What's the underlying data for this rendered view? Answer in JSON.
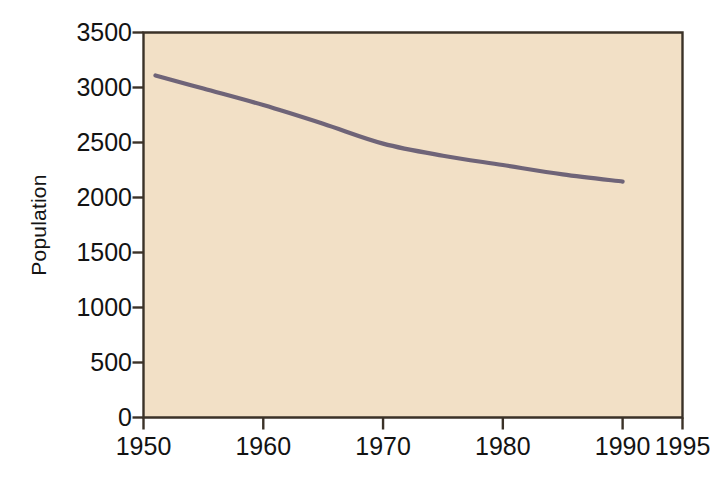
{
  "figure": {
    "background_color": "#ffffff",
    "plot_background_color": "#f2e0c6",
    "axis_color": "#3b3228",
    "line_color": "#6f6478"
  },
  "chart_data": {
    "type": "line",
    "title": "",
    "subtitle": "",
    "xlabel": "",
    "ylabel": "Population",
    "xlim": [
      1950,
      1995
    ],
    "ylim": [
      0,
      3500
    ],
    "grid": false,
    "legend": null,
    "x_ticks": [
      1950,
      1960,
      1970,
      1980,
      1990,
      1995
    ],
    "x_tick_labels": [
      "1950",
      "1960",
      "1970",
      "1980",
      "1990",
      "1995"
    ],
    "y_ticks": [
      0,
      500,
      1000,
      1500,
      2000,
      2500,
      3000,
      3500
    ],
    "y_tick_labels": [
      "0",
      "500",
      "1000",
      "1500",
      "2000",
      "2500",
      "3000",
      "3500"
    ],
    "series": [
      {
        "name": "Population",
        "color": "#6f6478",
        "x": [
          1951,
          1955,
          1960,
          1965,
          1970,
          1975,
          1980,
          1985,
          1990
        ],
        "values": [
          3110,
          2990,
          2840,
          2670,
          2490,
          2380,
          2295,
          2210,
          2145
        ]
      }
    ]
  }
}
